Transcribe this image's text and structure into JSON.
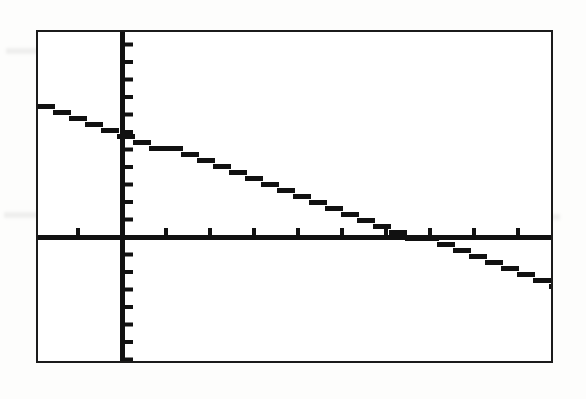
{
  "device": {
    "name": "graphing-calculator-screen",
    "screen_border_color": "#1b1b1b",
    "screen_background": "#ffffff",
    "pixel_color": "#111111"
  },
  "chart_data": {
    "type": "line",
    "title": "",
    "subtitle": "",
    "xlabel": "",
    "ylabel": "",
    "grid": false,
    "legend": null,
    "legend_position": "none",
    "axes": {
      "x_axis_visible": true,
      "y_axis_visible": true,
      "x_axis_pixel_y": 237,
      "y_axis_pixel_x": 122,
      "tick_marks": true,
      "x_tick_spacing_px": 44,
      "y_tick_spacing_px": 17.5,
      "x_ticks_left_of_origin": 2,
      "x_ticks_right_of_origin": 9,
      "y_ticks_above_origin": 11,
      "y_ticks_below_origin": 7,
      "xlim": [
        -10,
        10
      ],
      "ylim": [
        -10,
        10
      ],
      "xscl": 1,
      "yscl": 1
    },
    "window": {
      "Xmin": -10,
      "Xmax": 10,
      "Xscl": 1,
      "Ymin": -10,
      "Ymax": 10,
      "Yscl": 1
    },
    "series": [
      {
        "name": "Y1",
        "style": "solid-pixelated",
        "color": "#111111",
        "slope": -0.62,
        "y_intercept": -6.1,
        "x_intercept": 6.7,
        "x": [
          -10,
          -6.7,
          -3.3,
          0,
          3.3,
          6.7,
          10
        ],
        "values": [
          0.1,
          -1.9,
          -3.9,
          -6.1,
          -8.0,
          -10.0,
          -11.9
        ],
        "endpoints_pixel": [
          {
            "x": 37,
            "y": 104
          },
          {
            "x": 553,
            "y": 285
          }
        ]
      }
    ],
    "annotations": []
  },
  "artifacts": {
    "ghost_rows": [
      {
        "left": 6,
        "top": 48,
        "width": 300
      },
      {
        "left": 330,
        "top": 50,
        "width": 130
      },
      {
        "left": 4,
        "top": 212,
        "width": 210
      },
      {
        "left": 250,
        "top": 214,
        "width": 190
      },
      {
        "left": 470,
        "top": 214,
        "width": 90
      }
    ]
  }
}
